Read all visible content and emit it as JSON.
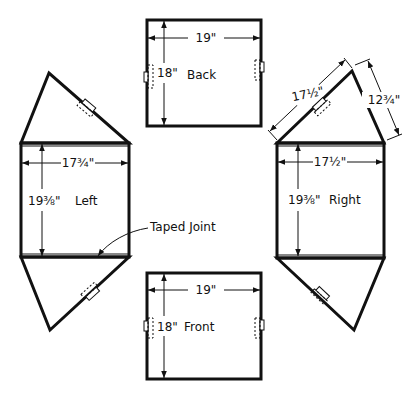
{
  "panels": {
    "back": {
      "name": "Back",
      "width": "19\"",
      "height": "18\""
    },
    "front": {
      "name": "Front",
      "width": "19\"",
      "height": "18\""
    },
    "left": {
      "name": "Left",
      "width": "17¾\"",
      "height": "19⅜\""
    },
    "right": {
      "name": "Right",
      "width": "17½\"",
      "height": "19⅜\"",
      "triangle_side_a": "17½\"",
      "triangle_side_b": "12¾\""
    }
  },
  "callouts": {
    "taped_joint": "Taped Joint"
  },
  "colors": {
    "ink": "#111111",
    "paper": "#ffffff"
  }
}
